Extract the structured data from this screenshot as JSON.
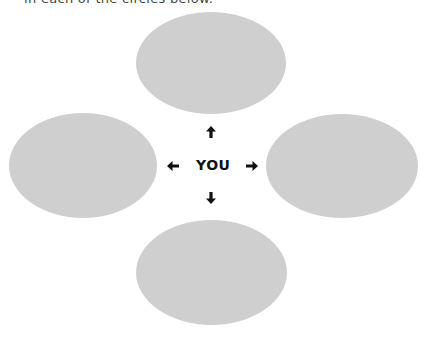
{
  "instruction": {
    "text": "in each of the circles below."
  },
  "diagram": {
    "center_label": "YOU",
    "ellipse_color": "#cfcfcf",
    "ellipses": [
      {
        "position": "top",
        "text": ""
      },
      {
        "position": "left",
        "text": ""
      },
      {
        "position": "right",
        "text": ""
      },
      {
        "position": "bottom",
        "text": ""
      }
    ],
    "arrows": [
      {
        "direction": "up",
        "icon": "arrow-up-icon"
      },
      {
        "direction": "left",
        "icon": "arrow-left-icon"
      },
      {
        "direction": "right",
        "icon": "arrow-right-icon"
      },
      {
        "direction": "down",
        "icon": "arrow-down-icon"
      }
    ]
  }
}
